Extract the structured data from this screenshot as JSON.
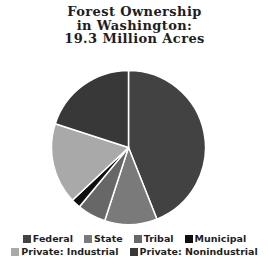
{
  "title": {
    "line1": "Forest Ownership",
    "line2": "in Washington:",
    "line3": "19.3 Million Acres"
  },
  "chart_data": {
    "type": "pie",
    "title": "Forest Ownership in Washington: 19.3 Million Acres",
    "total": "19.3 Million Acres",
    "categories": [
      "Federal",
      "State",
      "Tribal",
      "Municipal",
      "Private: Industrial",
      "Private: Nonindustrial"
    ],
    "values_pct": [
      44,
      11,
      6,
      2,
      17,
      20
    ],
    "colors": [
      "#424242",
      "#7a7a7a",
      "#676767",
      "#0f0f0f",
      "#a9a9a9",
      "#383838"
    ],
    "slice_border_color": "#ffffff",
    "start_angle_deg": 0,
    "direction": "clockwise",
    "legend_position": "bottom",
    "legend_rows": [
      [
        0,
        1,
        2,
        3
      ],
      [
        4,
        5
      ]
    ]
  }
}
